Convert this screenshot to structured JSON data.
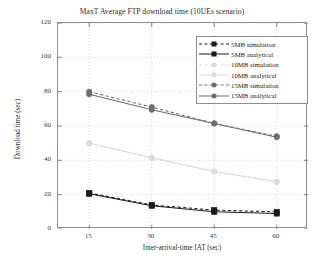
{
  "figure": {
    "title": "MaxT Average FTP download time (10UEs scenario)",
    "xtitle": "Inter-arrival-time IAT (sec)",
    "ytitle": "Download time (sec)"
  },
  "legend": {
    "entries": [
      {
        "label": "5MB simulation",
        "color": "#1a1a1a",
        "marker": "square",
        "style": "dashed"
      },
      {
        "label": "5MB analytical",
        "color": "#1a1a1a",
        "marker": "square",
        "style": "solid"
      },
      {
        "label": "10MB simulation",
        "color": "#dcdcdc",
        "marker": "circle",
        "style": "dashed"
      },
      {
        "label": "10MB analytical",
        "color": "#dcdcdc",
        "marker": "circle",
        "style": "solid"
      },
      {
        "label": "15MB simulation",
        "color": "#6e6e6e",
        "marker": "circle",
        "style": "dashed"
      },
      {
        "label": "15MB analytical",
        "color": "#6e6e6e",
        "marker": "circle",
        "style": "solid"
      }
    ]
  },
  "chart_data": {
    "type": "line",
    "title": "MaxT Average FTP download time (10UEs scenario)",
    "xlabel": "Inter-arrival-time IAT (sec)",
    "ylabel": "Download time (sec)",
    "x": [
      15,
      30,
      45,
      60
    ],
    "xlim": [
      7.5,
      67.5
    ],
    "ylim": [
      0,
      120
    ],
    "xticks": [
      15,
      30,
      45,
      60
    ],
    "yticks": [
      0,
      20,
      40,
      60,
      80,
      100,
      120
    ],
    "grid": true,
    "legend_position": "upper right",
    "series": [
      {
        "name": "5MB simulation",
        "values": [
          21,
          14,
          11,
          10
        ],
        "color": "#1a1a1a",
        "marker": "square",
        "style": "dashed"
      },
      {
        "name": "5MB analytical",
        "values": [
          20.5,
          13.5,
          10,
          9
        ],
        "color": "#1a1a1a",
        "marker": "square",
        "style": "solid"
      },
      {
        "name": "10MB simulation",
        "values": [
          50,
          41.5,
          33.5,
          27.5
        ],
        "color": "#dcdcdc",
        "marker": "circle",
        "style": "dashed"
      },
      {
        "name": "10MB analytical",
        "values": [
          50,
          41.5,
          33.5,
          27.5
        ],
        "color": "#dcdcdc",
        "marker": "circle",
        "style": "solid"
      },
      {
        "name": "15MB simulation",
        "values": [
          80,
          71,
          61.5,
          54
        ],
        "color": "#6e6e6e",
        "marker": "circle",
        "style": "dashed"
      },
      {
        "name": "15MB analytical",
        "values": [
          78.5,
          69.5,
          61.5,
          53.5
        ],
        "color": "#6e6e6e",
        "marker": "circle",
        "style": "solid"
      }
    ]
  },
  "axes": {
    "ytick_labels": [
      "120",
      "100",
      "80",
      "60",
      "40",
      "20",
      "0"
    ],
    "xtick_labels": [
      "15",
      "30",
      "45",
      "60"
    ]
  }
}
